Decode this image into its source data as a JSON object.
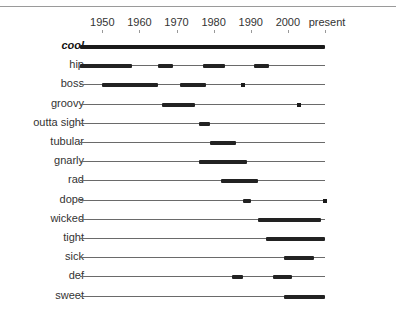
{
  "chart_data": {
    "type": "timeline",
    "title": "",
    "xlabel": "",
    "ylabel": "",
    "x_ticks": [
      "1950",
      "1960",
      "1970",
      "1980",
      "1990",
      "2000",
      "present"
    ],
    "x_range": [
      1944,
      2010
    ],
    "grid": false,
    "legend": null,
    "series": [
      {
        "name": "cool",
        "emphasized": true,
        "spans": [
          [
            1944,
            2010
          ]
        ],
        "dots": []
      },
      {
        "name": "hip",
        "spans": [
          [
            1944,
            1958
          ],
          [
            1965,
            1969
          ],
          [
            1977,
            1983
          ],
          [
            1991,
            1995
          ]
        ],
        "dots": []
      },
      {
        "name": "boss",
        "spans": [
          [
            1950,
            1965
          ],
          [
            1971,
            1978
          ]
        ],
        "dots": [
          1988
        ]
      },
      {
        "name": "groovy",
        "spans": [
          [
            1966,
            1975
          ]
        ],
        "dots": [
          2003
        ]
      },
      {
        "name": "outta sight",
        "spans": [
          [
            1976,
            1979
          ]
        ],
        "dots": []
      },
      {
        "name": "tubular",
        "spans": [
          [
            1979,
            1986
          ]
        ],
        "dots": []
      },
      {
        "name": "gnarly",
        "spans": [
          [
            1976,
            1989
          ]
        ],
        "dots": []
      },
      {
        "name": "rad",
        "spans": [
          [
            1982,
            1992
          ]
        ],
        "dots": []
      },
      {
        "name": "dope",
        "spans": [
          [
            1988,
            1990
          ]
        ],
        "dots": [
          2010
        ]
      },
      {
        "name": "wicked",
        "spans": [
          [
            1992,
            2009
          ]
        ],
        "dots": []
      },
      {
        "name": "tight",
        "spans": [
          [
            1994,
            2010
          ]
        ],
        "dots": []
      },
      {
        "name": "sick",
        "spans": [
          [
            1999,
            2007
          ]
        ],
        "dots": []
      },
      {
        "name": "def",
        "spans": [
          [
            1985,
            1988
          ],
          [
            1996,
            2001
          ]
        ],
        "dots": []
      },
      {
        "name": "sweet",
        "spans": [
          [
            1999,
            2010
          ]
        ],
        "dots": []
      }
    ]
  },
  "axis": {
    "labels": [
      "1950",
      "1960",
      "1970",
      "1980",
      "1990",
      "2000",
      "present"
    ]
  },
  "colors": {
    "bar": "#1a1a1a",
    "line": "#6a6a6a",
    "text": "#333333"
  }
}
